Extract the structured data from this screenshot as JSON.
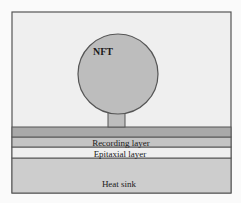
{
  "diagram": {
    "labels": {
      "nft": "NFT",
      "recording_layer": "Recording layer",
      "epitaxial_layer": "Epitaxial layer",
      "heat_sink": "Heat sink"
    },
    "colors": {
      "background": "#fafafa",
      "frame_fill": "#efefef",
      "frame_stroke": "#555555",
      "nft_fill": "#bdbdbd",
      "top_layer_fill": "#a9a9a9",
      "recording_fill": "#c4c4c4",
      "epitaxial_fill": "#efefef",
      "heat_sink_fill": "#cdcdcd"
    }
  }
}
